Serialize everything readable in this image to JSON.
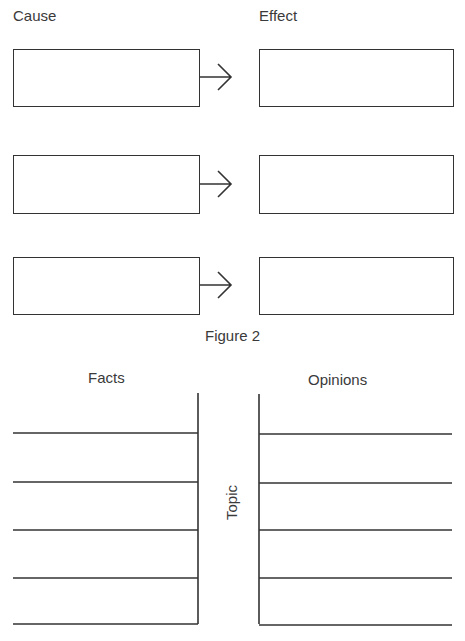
{
  "figure": {
    "cause_label": "Cause",
    "effect_label": "Effect",
    "caption": "Figure 2",
    "rows": [
      {
        "cause": "",
        "effect": ""
      },
      {
        "cause": "",
        "effect": ""
      },
      {
        "cause": "",
        "effect": ""
      }
    ]
  },
  "organizer": {
    "facts_label": "Facts",
    "opinions_label": "Opinions",
    "topic_label": "Topic",
    "facts_lines": [
      "",
      "",
      "",
      "",
      ""
    ],
    "opinions_lines": [
      "",
      "",
      "",
      "",
      ""
    ]
  }
}
